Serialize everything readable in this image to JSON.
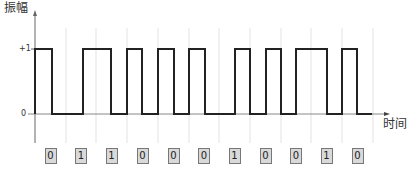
{
  "title_y": "振幅",
  "title_x": "时间",
  "ticks": {
    "high": "+1",
    "low": "0"
  },
  "bits": [
    "0",
    "1",
    "1",
    "0",
    "0",
    "0",
    "1",
    "0",
    "0",
    "1",
    "0"
  ],
  "chart_data": {
    "type": "line",
    "title": "",
    "xlabel": "时间",
    "ylabel": "振幅",
    "y_ticks": [
      "0",
      "+1"
    ],
    "bit_labels": [
      "0",
      "1",
      "1",
      "0",
      "0",
      "0",
      "1",
      "0",
      "0",
      "1",
      "0"
    ],
    "waveform_transitions_x": [
      35,
      52,
      83,
      111,
      127,
      142,
      158,
      174,
      189,
      205,
      235,
      250,
      266,
      281,
      296,
      327,
      342,
      357,
      372
    ],
    "gridlines_x": [
      35,
      66,
      96,
      127,
      158,
      189,
      219,
      250,
      281,
      311,
      342,
      373
    ],
    "levels": {
      "high_y": 49,
      "low_y": 114
    },
    "grid": true
  }
}
